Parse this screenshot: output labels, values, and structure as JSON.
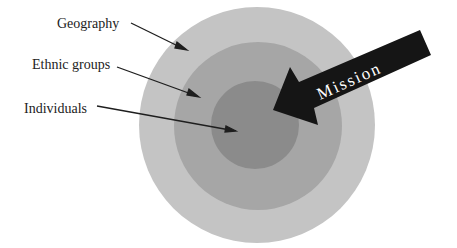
{
  "diagram": {
    "type": "concentric-target",
    "rings": [
      {
        "name": "Geography",
        "color": "#c4c4c4"
      },
      {
        "name": "Ethnic groups",
        "color": "#a6a6a6"
      },
      {
        "name": "Individuals",
        "color": "#8a8a8a"
      }
    ],
    "labels": {
      "geography": "Geography",
      "ethnic_groups": "Ethnic groups",
      "individuals": "Individuals"
    },
    "arrow": {
      "label": "Mission",
      "color": "#1a1a1a",
      "text_color": "#ffffff"
    }
  }
}
